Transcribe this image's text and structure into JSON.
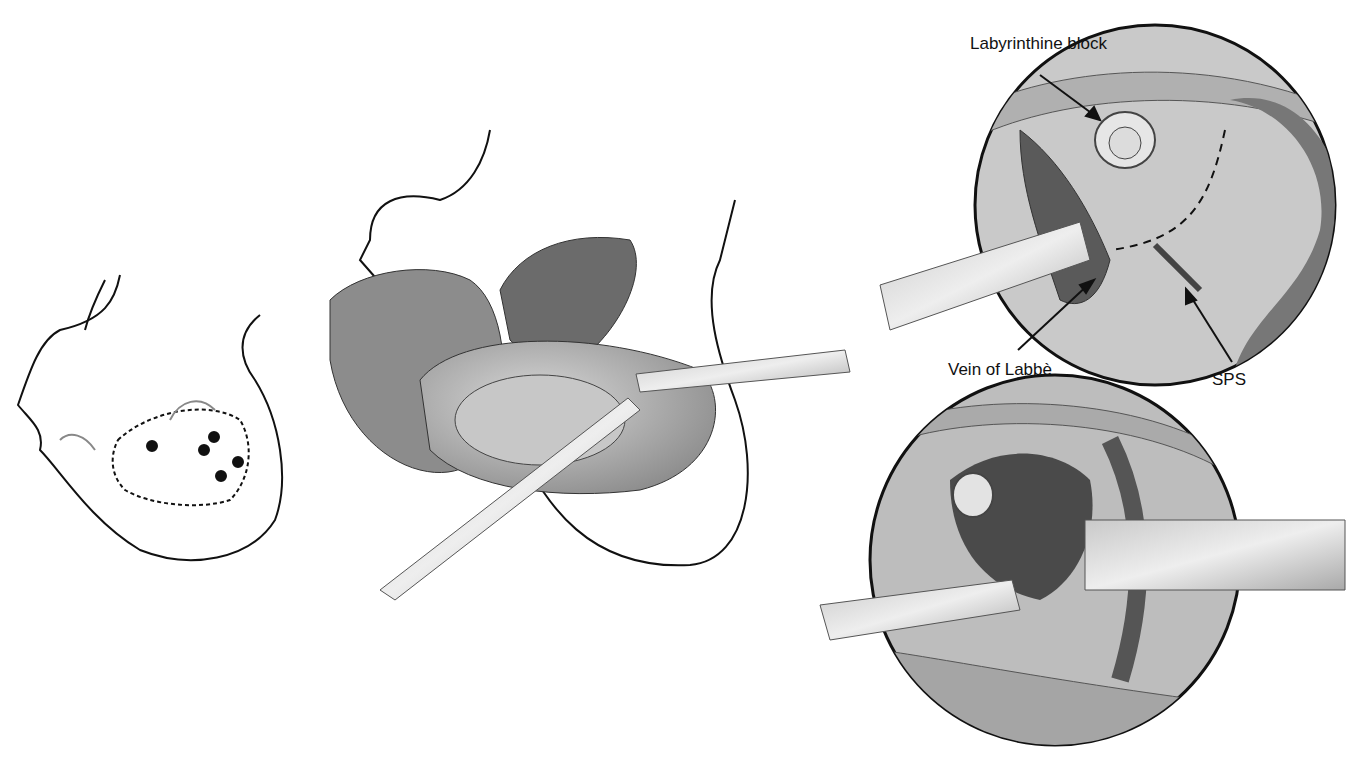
{
  "figure": {
    "panels": [
      {
        "id": "head-incision",
        "content": "Head positioned with curved incision line and pin sites"
      },
      {
        "id": "craniotomy-exposure",
        "content": "Scalp flap reflected, temporal lobe retracted"
      },
      {
        "id": "magnified-view-1",
        "content": "Magnified circular view"
      },
      {
        "id": "magnified-view-2",
        "content": "Magnified circular view with fibrous tissue"
      }
    ],
    "labels": {
      "labyrinthine_block": "Labyrinthine block",
      "vein_of_labbe": "Vein of Labbè",
      "sps": "SPS"
    }
  }
}
